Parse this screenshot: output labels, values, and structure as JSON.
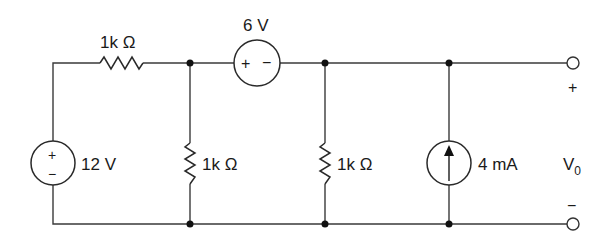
{
  "diagram": {
    "type": "circuit-schematic",
    "components": {
      "r_series": {
        "label": "1k Ω"
      },
      "v_source_12": {
        "label": "12 V",
        "plus": "+",
        "minus": "−"
      },
      "v_source_6": {
        "label": "6 V",
        "plus": "+",
        "minus": "−"
      },
      "r_shunt_1": {
        "label": "1k Ω"
      },
      "r_shunt_2": {
        "label": "1k Ω"
      },
      "i_source": {
        "label": "4 mA",
        "direction": "up"
      }
    },
    "output": {
      "label": "V",
      "subscript": "0",
      "plus": "+",
      "minus": "−"
    }
  }
}
